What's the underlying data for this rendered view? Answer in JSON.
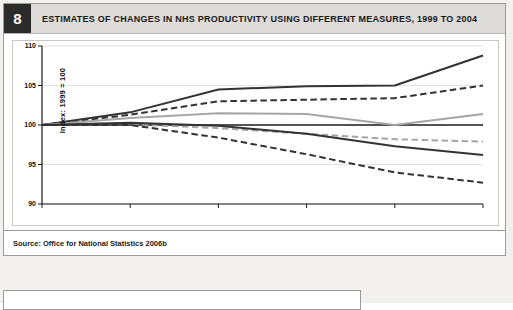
{
  "figure": {
    "number": "8",
    "title": "ESTIMATES OF CHANGES IN NHS PRODUCTIVITY USING DIFFERENT MEASURES, 1999 TO 2004",
    "source": "Source: Office for National Statistics 2006b"
  },
  "chart_data": {
    "type": "line",
    "title": "ESTIMATES OF CHANGES IN NHS PRODUCTIVITY USING DIFFERENT MEASURES, 1999 TO 2004",
    "subtitle": "",
    "xlabel": "Year",
    "ylabel": "Index: 1999 = 100",
    "x": [
      "1999",
      "2000",
      "2001",
      "2002",
      "2003",
      "2004"
    ],
    "categories": [
      "1999",
      "2000",
      "2001",
      "2002",
      "2003",
      "2004"
    ],
    "xlim": [
      "1999",
      "2004"
    ],
    "ylim": [
      90,
      110
    ],
    "yticks": [
      90,
      95,
      100,
      105,
      110
    ],
    "xticks": [
      "1999",
      "2000",
      "2001",
      "2002",
      "2003",
      "2004"
    ],
    "grid": "horizontal",
    "legend": "none",
    "annotations": [],
    "series": [
      {
        "name": "measure-1-dark-solid-upper",
        "style": "solid",
        "color": "#333333",
        "width": 2.0,
        "values": [
          100,
          101.6,
          104.5,
          104.9,
          105.0,
          108.8
        ]
      },
      {
        "name": "measure-2-dark-dashed-upper",
        "style": "dashed",
        "color": "#333333",
        "width": 2.0,
        "values": [
          100,
          101.3,
          103.0,
          103.2,
          103.4,
          105.0
        ]
      },
      {
        "name": "measure-3-gray-solid",
        "style": "solid",
        "color": "#a6a6a6",
        "width": 2.0,
        "values": [
          100,
          100.9,
          101.5,
          101.4,
          100.0,
          101.4
        ]
      },
      {
        "name": "measure-4-gray-dashed",
        "style": "dashed",
        "color": "#a6a6a6",
        "width": 2.0,
        "values": [
          100,
          100.1,
          99.6,
          98.9,
          98.2,
          97.9
        ]
      },
      {
        "name": "measure-5-dark-solid-lower",
        "style": "solid",
        "color": "#333333",
        "width": 2.0,
        "values": [
          100,
          100.3,
          99.9,
          98.9,
          97.3,
          96.2
        ]
      },
      {
        "name": "measure-6-dark-dashed-lower",
        "style": "dashed",
        "color": "#333333",
        "width": 2.0,
        "values": [
          100,
          100.0,
          98.4,
          96.3,
          94.0,
          92.7
        ]
      }
    ]
  }
}
